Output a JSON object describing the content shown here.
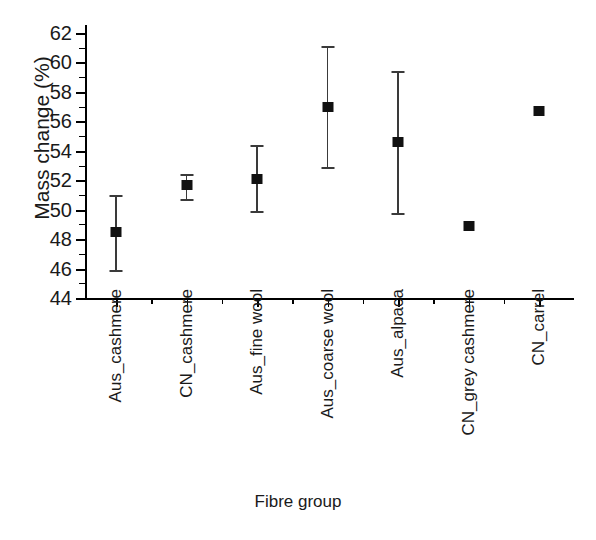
{
  "chart_data": {
    "type": "scatter",
    "title": "",
    "xlabel": "Fibre group",
    "ylabel": "Mass change (%)",
    "ylim": [
      44,
      62
    ],
    "y_major_ticks": [
      44,
      46,
      48,
      50,
      52,
      54,
      56,
      58,
      60,
      62
    ],
    "y_minor_ticks": [
      45,
      47,
      49,
      51,
      53,
      55,
      57,
      59,
      61
    ],
    "grid": false,
    "legend": "none",
    "error_bar_style": "vertical-with-caps",
    "marker_style": "filled-square",
    "marker_color": "#111111",
    "error_color": "#3a3a3a",
    "categories": [
      "Aus_cashmere",
      "CN_cashmere",
      "Aus_fine wool",
      "Aus_coarse wool",
      "Aus_alpaca",
      "CN_grey cashmere",
      "CN_carrel"
    ],
    "values": [
      48.5,
      51.7,
      52.1,
      57.0,
      54.6,
      48.9,
      56.7
    ],
    "err_low": [
      45.9,
      50.7,
      49.9,
      52.9,
      49.8,
      null,
      null
    ],
    "err_high": [
      51.0,
      52.4,
      54.4,
      61.1,
      59.4,
      null,
      null
    ],
    "points": [
      {
        "label": "Aus_cashmere",
        "value": 48.5,
        "low": 45.9,
        "high": 51.0,
        "has_error_bar": true
      },
      {
        "label": "CN_cashmere",
        "value": 51.7,
        "low": 50.7,
        "high": 52.4,
        "has_error_bar": true
      },
      {
        "label": "Aus_fine wool",
        "value": 52.1,
        "low": 49.9,
        "high": 54.4,
        "has_error_bar": true
      },
      {
        "label": "Aus_coarse wool",
        "value": 57.0,
        "low": 52.9,
        "high": 61.1,
        "has_error_bar": true
      },
      {
        "label": "Aus_alpaca",
        "value": 54.6,
        "low": 49.8,
        "high": 59.4,
        "has_error_bar": true
      },
      {
        "label": "CN_grey cashmere",
        "value": 48.9,
        "low": null,
        "high": null,
        "has_error_bar": false
      },
      {
        "label": "CN_carrel",
        "value": 56.7,
        "low": null,
        "high": null,
        "has_error_bar": false
      }
    ]
  },
  "axes": {
    "y_title": "Mass change (%)",
    "x_title": "Fibre group",
    "y_labels": [
      "62",
      "60",
      "58",
      "56",
      "54",
      "52",
      "50",
      "48",
      "46",
      "44"
    ]
  }
}
